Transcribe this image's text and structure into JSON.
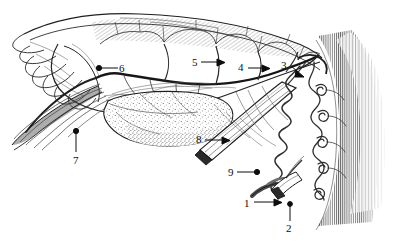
{
  "figure": {
    "background_color": "#ffffff",
    "ink_color": "#1a1a1a",
    "stipple_color": "#555555",
    "vessel_color": "#3a3a3a",
    "label_font_size_px": 11,
    "width_px": 393,
    "height_px": 243
  },
  "labels": [
    {
      "id": "label-1",
      "text": "1",
      "x": 244,
      "y": 198,
      "leader": "arrow-right",
      "target": "cut-vessel-lower-left"
    },
    {
      "id": "label-2",
      "text": "2",
      "x": 286,
      "y": 223,
      "leader": "line-up",
      "target": "cut-vessel-lower-right"
    },
    {
      "id": "label-3",
      "text": "3",
      "x": 281,
      "y": 60,
      "leader": "arrow-down-right",
      "target": "vessel-junction-near-uterus"
    },
    {
      "id": "label-4",
      "text": "4",
      "x": 238,
      "y": 62,
      "leader": "arrow-right",
      "target": "arcade-branch-point-4"
    },
    {
      "id": "label-5",
      "text": "5",
      "x": 192,
      "y": 57,
      "leader": "arrow-right",
      "target": "arcade-branch-point-5"
    },
    {
      "id": "label-6",
      "text": "6",
      "x": 119,
      "y": 63,
      "leader": "line-left",
      "target": "fimbriated-end-vessel"
    },
    {
      "id": "label-7",
      "text": "7",
      "x": 73,
      "y": 155,
      "leader": "line-up",
      "target": "tapering-ligament-left"
    },
    {
      "id": "label-8",
      "text": "8",
      "x": 196,
      "y": 134,
      "leader": "arrow-right",
      "target": "cut-tubular-structure"
    },
    {
      "id": "label-9",
      "text": "9",
      "x": 228,
      "y": 167,
      "leader": "arrow-right",
      "target": "coiled-spiral-vessel"
    }
  ],
  "caption": {
    "ghost_text": ""
  }
}
